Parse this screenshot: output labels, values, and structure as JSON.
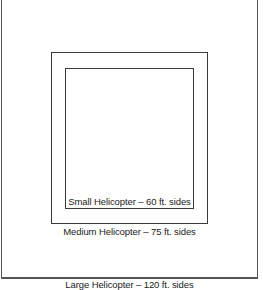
{
  "diagram": {
    "zones": [
      {
        "name": "Small Helicopter",
        "side_ft": 60,
        "label": "Small Helicopter – 60 ft. sides"
      },
      {
        "name": "Medium Helicopter",
        "side_ft": 75,
        "label": "Medium Helicopter – 75 ft. sides"
      },
      {
        "name": "Large Helicopter",
        "side_ft": 120,
        "label": "Large Helicopter – 120 ft. sides"
      }
    ],
    "colors": {
      "line": "#3a3a3a",
      "background": "#ffffff",
      "text": "#222222"
    }
  }
}
